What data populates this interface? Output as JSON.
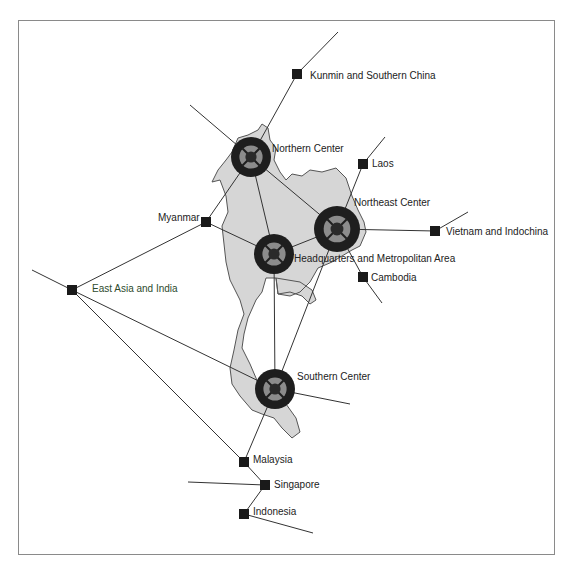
{
  "frame": {
    "x": 18,
    "y": 20,
    "w": 537,
    "h": 535
  },
  "colors": {
    "land": "#d6d6d6",
    "hub": "#1e1e1e",
    "hub_ring": "#8c8c8c",
    "node": "#1a1a1a",
    "line": "#333333"
  },
  "hubs": [
    {
      "id": "northern",
      "label": "Northern Center",
      "x": 251,
      "y": 157,
      "r": 20,
      "label_x": 272,
      "label_y": 152
    },
    {
      "id": "northeast",
      "label": "Northeast Center",
      "x": 337,
      "y": 229,
      "r": 23,
      "label_x": 354,
      "label_y": 206
    },
    {
      "id": "hq",
      "label": "Headquarters and Metropolitan Area",
      "x": 274,
      "y": 254,
      "r": 20,
      "label_x": 294,
      "label_y": 262
    },
    {
      "id": "southern",
      "label": "Southern Center",
      "x": 275,
      "y": 389,
      "r": 20,
      "label_x": 297,
      "label_y": 380
    }
  ],
  "nodes": [
    {
      "id": "kunming",
      "label": "Kunmin and Southern China",
      "x": 297,
      "y": 74,
      "label_x": 310,
      "label_y": 79
    },
    {
      "id": "laos",
      "label": "Laos",
      "x": 363,
      "y": 164,
      "label_x": 372,
      "label_y": 167
    },
    {
      "id": "myanmar",
      "label": "Myanmar",
      "x": 206,
      "y": 222,
      "label_x": 158,
      "label_y": 221
    },
    {
      "id": "vietnam",
      "label": "Vietnam and Indochina",
      "x": 435,
      "y": 231,
      "label_x": 446,
      "label_y": 235
    },
    {
      "id": "cambodia",
      "label": "Cambodia",
      "x": 363,
      "y": 277,
      "label_x": 371,
      "label_y": 281
    },
    {
      "id": "eastasia",
      "label": "East Asia and India",
      "x": 72,
      "y": 290,
      "label_x": 92,
      "label_y": 292,
      "green": true
    },
    {
      "id": "malaysia",
      "label": "Malaysia",
      "x": 244,
      "y": 462,
      "label_x": 253,
      "label_y": 463
    },
    {
      "id": "singapore",
      "label": "Singapore",
      "x": 265,
      "y": 485,
      "label_x": 274,
      "label_y": 488
    },
    {
      "id": "indonesia",
      "label": "Indonesia",
      "x": 244,
      "y": 514,
      "label_x": 253,
      "label_y": 515
    }
  ],
  "edges": [
    [
      338,
      32,
      297,
      74
    ],
    [
      297,
      74,
      251,
      157
    ],
    [
      190,
      105,
      251,
      157
    ],
    [
      251,
      157,
      206,
      222
    ],
    [
      251,
      157,
      274,
      254
    ],
    [
      251,
      157,
      337,
      229
    ],
    [
      385,
      137,
      363,
      164
    ],
    [
      363,
      164,
      337,
      229
    ],
    [
      206,
      222,
      274,
      254
    ],
    [
      206,
      222,
      72,
      290
    ],
    [
      274,
      254,
      337,
      229
    ],
    [
      274,
      254,
      275,
      389
    ],
    [
      337,
      229,
      435,
      231
    ],
    [
      435,
      231,
      468,
      212
    ],
    [
      337,
      229,
      363,
      277
    ],
    [
      363,
      277,
      382,
      303
    ],
    [
      337,
      229,
      275,
      389
    ],
    [
      32,
      270,
      72,
      290
    ],
    [
      72,
      290,
      275,
      389
    ],
    [
      72,
      290,
      244,
      462
    ],
    [
      275,
      389,
      350,
      404
    ],
    [
      275,
      389,
      244,
      462
    ],
    [
      244,
      462,
      265,
      485
    ],
    [
      188,
      482,
      265,
      485
    ],
    [
      265,
      485,
      244,
      514
    ],
    [
      244,
      514,
      313,
      533
    ]
  ],
  "outline": "M 232,152 L 238,138 L 248,135 L 258,130 L 262,124 L 268,128 L 270,140 L 276,148 L 274,160 L 280,172 L 286,180 L 292,174 L 302,176 L 310,170 L 322,172 L 336,168 L 346,178 L 352,196 L 358,210 L 364,222 L 366,232 L 360,246 L 352,250 L 342,256 L 332,262 L 318,268 L 310,282 L 300,292 L 290,296 L 278,294 L 276,278 L 266,278 L 262,292 L 256,300 L 248,318 L 244,334 L 242,348 L 250,364 L 256,378 L 262,392 L 268,400 L 286,404 L 296,418 L 300,432 L 292,438 L 282,428 L 274,418 L 262,414 L 252,410 L 240,396 L 232,384 L 230,368 L 234,350 L 238,330 L 244,314 L 240,300 L 230,280 L 226,262 L 224,244 L 222,226 L 228,212 L 226,196 L 220,180 L 212,182 L 218,170 L 226,160 Z M 276,278 L 300,282 L 312,290 L 316,300 L 310,304 L 302,296 L 290,292 L 278,294 Z"
}
